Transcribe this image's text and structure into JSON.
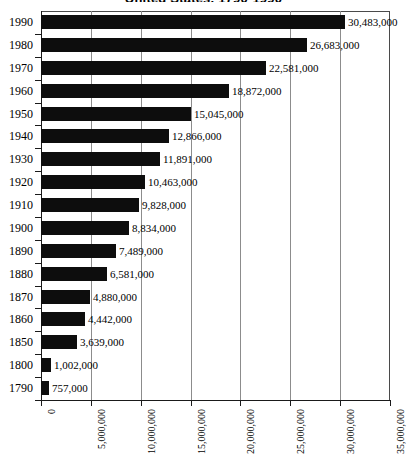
{
  "chart_data": {
    "type": "bar",
    "orientation": "horizontal",
    "title": "United States, 1790-1990",
    "xlabel": "",
    "ylabel": "",
    "xlim": [
      0,
      35000000
    ],
    "grid": true,
    "legend": "none",
    "categories": [
      "1990",
      "1980",
      "1970",
      "1960",
      "1950",
      "1940",
      "1930",
      "1920",
      "1910",
      "1900",
      "1890",
      "1880",
      "1870",
      "1860",
      "1850",
      "1800",
      "1790"
    ],
    "values": [
      30483000,
      26683000,
      22581000,
      18872000,
      15045000,
      12866000,
      11891000,
      10463000,
      9828000,
      8834000,
      7489000,
      6581000,
      4880000,
      4442000,
      3639000,
      1002000,
      757000
    ],
    "value_labels": [
      "30,483,000",
      "26,683,000",
      "22,581,000",
      "18,872,000",
      "15,045,000",
      "12,866,000",
      "11,891,000",
      "10,463,000",
      "9,828,000",
      "8,834,000",
      "7,489,000",
      "6,581,000",
      "4,880,000",
      "4,442,000",
      "3,639,000",
      "1,002,000",
      "757,000"
    ],
    "x_ticks": [
      0,
      5000000,
      10000000,
      15000000,
      20000000,
      25000000,
      30000000,
      35000000
    ],
    "x_tick_labels": [
      "0",
      "5,000,000",
      "10,000,000",
      "15,000,000",
      "20,000,000",
      "25,000,000",
      "30,000,000",
      "35,000,000"
    ],
    "bar_color": "#0d0d0d",
    "grid_color": "#8c8c8c",
    "axis_color": "#1a1a1a",
    "background_color": "#ffffff"
  }
}
